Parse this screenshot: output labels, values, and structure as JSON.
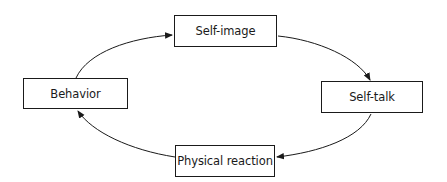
{
  "diagram": {
    "type": "cycle",
    "nodes": [
      {
        "id": "self-image",
        "label": "Self-image"
      },
      {
        "id": "self-talk",
        "label": "Self-talk"
      },
      {
        "id": "physical-reaction",
        "label": "Physical reaction"
      },
      {
        "id": "behavior",
        "label": "Behavior"
      }
    ],
    "edges": [
      {
        "from": "self-image",
        "to": "self-talk"
      },
      {
        "from": "self-talk",
        "to": "physical-reaction"
      },
      {
        "from": "physical-reaction",
        "to": "behavior"
      },
      {
        "from": "behavior",
        "to": "self-image"
      }
    ],
    "colors": {
      "stroke": "#1a1a1a",
      "background": "#ffffff"
    }
  }
}
